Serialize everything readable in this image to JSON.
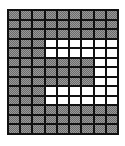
{
  "grid": {
    "rows": 13,
    "cols": 9,
    "colors": {
      "shaded": "#9a9a9a",
      "blank": "#ffffff",
      "line": "#111111"
    },
    "cells": [
      "SSSSSSSSS",
      "SSSSSSSSS",
      "SSSSSSSSS",
      "SSSBBBBBB",
      "SSSBBBBBB",
      "SSSSSSSBB",
      "SSSSSSSBB",
      "SSSSSSSBB",
      "SSSBBBBBB",
      "SSSBBBBBB",
      "SSSSSSSSS",
      "SSSSSSSSS",
      "SSSSSSSSS"
    ]
  }
}
